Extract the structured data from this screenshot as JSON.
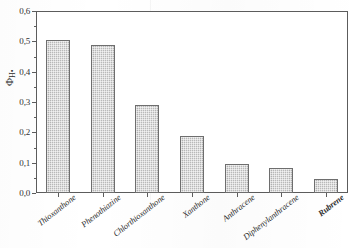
{
  "chart_data": {
    "type": "bar",
    "title": "",
    "subtitle": "",
    "xlabel": "",
    "ylabel": "ΦH•",
    "ylabel_symbol": "Φ",
    "ylabel_subscript": "H•",
    "categories": [
      "Thioxanthone",
      "Phenothiazine",
      "Chlorthioxanthone",
      "Xanthone",
      "Anthracene",
      "Diphenylanthracene",
      "Rubrene"
    ],
    "values": [
      0.503,
      0.487,
      0.289,
      0.188,
      0.095,
      0.082,
      0.045
    ],
    "ylim": [
      0.0,
      0.6
    ],
    "y_major_ticks": [
      0.0,
      0.1,
      0.2,
      0.3,
      0.4,
      0.5,
      0.6
    ],
    "y_tick_labels": [
      "0,0",
      "0,1",
      "0,2",
      "0,3",
      "0,4",
      "0,5",
      "0,6"
    ],
    "y_minor_ticks": [
      0.05,
      0.15,
      0.25,
      0.35,
      0.45,
      0.55
    ],
    "grid": false,
    "legend": false,
    "legend_position": "none",
    "bar_fill_color": "#b9b9b9",
    "bar_edge_color": "#6e6e6e",
    "axis_color": "#5c5c5c",
    "background_color": "#ffffff",
    "xtick_label_rotation": -38,
    "xtick_label_style": "italic-serif"
  }
}
